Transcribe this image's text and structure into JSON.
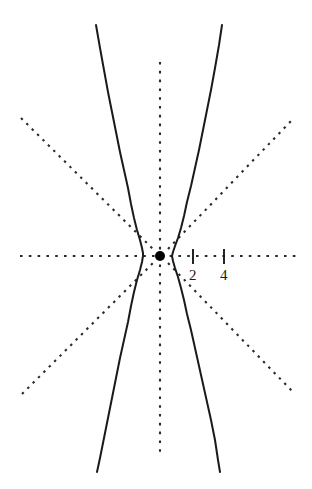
{
  "chart_data": {
    "type": "line",
    "title": "",
    "subtitle": "",
    "xlabel": "",
    "ylabel": "",
    "grid": false,
    "legend": null,
    "background_color": "#ffffff",
    "curve_color": "#1a1a1a",
    "axis_color": "#2a2a2a",
    "asymptote_color": "#2a2a2a",
    "center_point_color": "#000000",
    "axis_style": "dashed",
    "asymptote_style": "dotted",
    "curve_style": "solid",
    "xlim": [
      -8.4,
      8.2
    ],
    "ylim": [
      -14.1,
      14.6
    ],
    "center": {
      "x": 0,
      "y": 0
    },
    "center_point_label": "",
    "x_ticks": [
      {
        "value": 2,
        "label": "2"
      },
      {
        "value": 4,
        "label": "4"
      }
    ],
    "y_ticks": [],
    "series": [
      {
        "name": "hyperbola-right-branch",
        "style": "solid",
        "vertex": {
          "x": 0.75,
          "y": 0
        },
        "points_px": [
          [
            222,
            25
          ],
          [
            219,
            45
          ],
          [
            215,
            68
          ],
          [
            211,
            90
          ],
          [
            207,
            110
          ],
          [
            203,
            130
          ],
          [
            199,
            150
          ],
          [
            195,
            168
          ],
          [
            191,
            186
          ],
          [
            187,
            202
          ],
          [
            184,
            216
          ],
          [
            181,
            228
          ],
          [
            178,
            238
          ],
          [
            175,
            246
          ],
          [
            173,
            252
          ],
          [
            172,
            256
          ],
          [
            173,
            261
          ],
          [
            175,
            268
          ],
          [
            178,
            277
          ],
          [
            181,
            288
          ],
          [
            184,
            300
          ],
          [
            187,
            314
          ],
          [
            191,
            330
          ],
          [
            195,
            348
          ],
          [
            199,
            366
          ],
          [
            203,
            384
          ],
          [
            207,
            402
          ],
          [
            211,
            420
          ],
          [
            215,
            440
          ],
          [
            218,
            460
          ],
          [
            220,
            472
          ]
        ]
      },
      {
        "name": "hyperbola-left-branch",
        "style": "solid",
        "vertex": {
          "x": -0.75,
          "y": 0
        },
        "points_px": [
          [
            96,
            25
          ],
          [
            100,
            48
          ],
          [
            104,
            70
          ],
          [
            108,
            92
          ],
          [
            112,
            112
          ],
          [
            116,
            132
          ],
          [
            120,
            152
          ],
          [
            124,
            170
          ],
          [
            128,
            188
          ],
          [
            131,
            204
          ],
          [
            134,
            218
          ],
          [
            137,
            230
          ],
          [
            140,
            240
          ],
          [
            142,
            248
          ],
          [
            143,
            253
          ],
          [
            143,
            256
          ],
          [
            142,
            262
          ],
          [
            140,
            270
          ],
          [
            137,
            280
          ],
          [
            134,
            292
          ],
          [
            131,
            306
          ],
          [
            128,
            322
          ],
          [
            124,
            340
          ],
          [
            120,
            358
          ],
          [
            116,
            378
          ],
          [
            112,
            398
          ],
          [
            108,
            418
          ],
          [
            104,
            438
          ],
          [
            100,
            458
          ],
          [
            97,
            472
          ]
        ]
      }
    ],
    "asymptotes": [
      {
        "name": "asymptote-upper-left",
        "slope": -1.0,
        "from_px": [
          21,
          118
        ],
        "to_px": [
          153,
          249
        ]
      },
      {
        "name": "asymptote-upper-right",
        "slope": 1.0,
        "from_px": [
          168,
          249
        ],
        "to_px": [
          291,
          121
        ]
      },
      {
        "name": "asymptote-lower-left",
        "slope": 1.0,
        "from_px": [
          22,
          394
        ],
        "to_px": [
          153,
          263
        ]
      },
      {
        "name": "asymptote-lower-right",
        "slope": -1.0,
        "from_px": [
          168,
          263
        ],
        "to_px": [
          292,
          391
        ]
      }
    ],
    "axes": {
      "x_axis_px": {
        "from": [
          20,
          256
        ],
        "to": [
          296,
          256
        ]
      },
      "y_axis_px": {
        "from": [
          160,
          62
        ],
        "to": [
          160,
          456
        ]
      }
    },
    "annotations": [
      {
        "name": "origin-dot",
        "x_px": 160,
        "y_px": 256,
        "radius_px": 5
      }
    ]
  }
}
